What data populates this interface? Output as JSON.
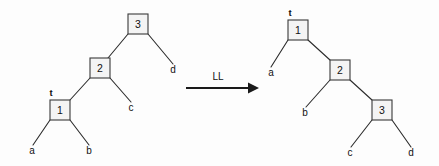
{
  "figure": {
    "background_color": "#fdfdfd",
    "line_color": "#2b2b2b",
    "node_fill_color": "#f4f4f4",
    "node_stroke_color": "#3a3a3a",
    "text_color": "#111111"
  },
  "transform": {
    "arrow_label": "LL",
    "arrow_direction": "right"
  },
  "left_tree": {
    "root_tag": "t",
    "nodes": [
      {
        "label": "3",
        "x": 138,
        "y": 24
      },
      {
        "label": "2",
        "x": 100,
        "y": 68
      },
      {
        "label": "1",
        "x": 60,
        "y": 110
      }
    ],
    "leaves": [
      {
        "label": "a",
        "x": 32,
        "y": 151
      },
      {
        "label": "b",
        "x": 89,
        "y": 151
      },
      {
        "label": "c",
        "x": 130,
        "y": 108
      },
      {
        "label": "d",
        "x": 173,
        "y": 70
      }
    ]
  },
  "right_tree": {
    "root_tag": "t",
    "nodes": [
      {
        "label": "1",
        "x": 298,
        "y": 30
      },
      {
        "label": "2",
        "x": 340,
        "y": 70
      },
      {
        "label": "3",
        "x": 382,
        "y": 110
      }
    ],
    "leaves": [
      {
        "label": "a",
        "x": 271,
        "y": 73
      },
      {
        "label": "b",
        "x": 305,
        "y": 113
      },
      {
        "label": "c",
        "x": 350,
        "y": 153
      },
      {
        "label": "d",
        "x": 411,
        "y": 153
      }
    ]
  }
}
